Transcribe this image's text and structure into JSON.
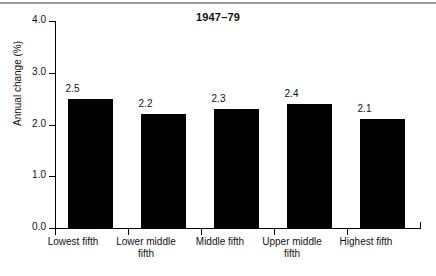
{
  "chart_data": {
    "type": "bar",
    "title": "1947–79",
    "xlabel": "",
    "ylabel": "Annual change (%)",
    "categories": [
      "Lowest fifth",
      "Lower middle fifth",
      "Middle fifth",
      "Upper middle fifth",
      "Highest fifth"
    ],
    "values": [
      2.5,
      2.2,
      2.3,
      2.4,
      2.1
    ],
    "value_labels": [
      "2.5",
      "2.2",
      "2.3",
      "2.4",
      "2.1"
    ],
    "ylim": [
      0.0,
      4.0
    ],
    "ytick_values": [
      0.0,
      1.0,
      2.0,
      3.0,
      4.0
    ],
    "ytick_labels": [
      "0.0",
      "1.0",
      "2.0",
      "3.0",
      "4.0"
    ],
    "grid": false,
    "legend": null,
    "bar_color": "#000000",
    "axis_color": "#000000",
    "background_color": "#ffffff"
  },
  "figure": {
    "top_rule_color": "#9a9a9a"
  }
}
